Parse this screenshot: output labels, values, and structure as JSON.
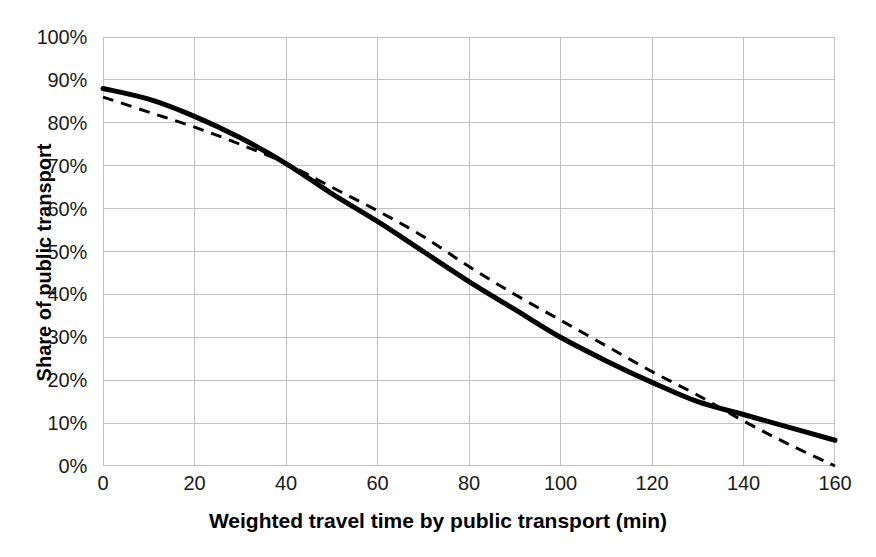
{
  "chart_data": {
    "type": "line",
    "title": "",
    "xlabel": "Weighted travel time by public transport (min)",
    "ylabel": "Share of public transport",
    "xlim": [
      0,
      160
    ],
    "ylim": [
      0,
      1.0
    ],
    "grid": true,
    "legend": "none",
    "x_ticks": [
      0,
      20,
      40,
      60,
      80,
      100,
      120,
      140,
      160
    ],
    "x_tick_labels": [
      "0",
      "20",
      "40",
      "60",
      "80",
      "100",
      "120",
      "140",
      "160"
    ],
    "y_ticks": [
      0,
      10,
      20,
      30,
      40,
      50,
      60,
      70,
      80,
      90,
      100
    ],
    "y_tick_labels": [
      "0%",
      "10%",
      "20%",
      "30%",
      "40%",
      "50%",
      "60%",
      "70%",
      "80%",
      "90%",
      "100%"
    ],
    "x": [
      0,
      10,
      20,
      30,
      40,
      50,
      60,
      70,
      80,
      90,
      100,
      110,
      120,
      130,
      140,
      150,
      160
    ],
    "series": [
      {
        "name": "Fitted logistic curve",
        "style": "solid",
        "color": "#000000",
        "width": 5,
        "values": [
          88,
          85.5,
          81.5,
          76.5,
          70.5,
          63.5,
          57,
          50,
          43,
          36.5,
          30,
          24.5,
          19.5,
          15,
          12,
          9,
          6
        ]
      },
      {
        "name": "Linear approximation",
        "style": "dashed",
        "color": "#000000",
        "width": 3,
        "values": [
          86,
          82.5,
          79,
          75,
          70.5,
          65,
          59.5,
          53.5,
          46.5,
          40,
          34,
          28,
          22,
          16.5,
          10.5,
          5,
          0
        ]
      }
    ],
    "annotations": {
      "crossings": [
        67,
        140
      ]
    },
    "colors": {
      "grid": "#c0c0c0",
      "axis": "#808080",
      "text": "#1a1a1a",
      "series": "#000000",
      "background": "#ffffff"
    }
  },
  "axes": {
    "x_title": "Weighted travel time by public transport (min)",
    "y_title": "Share of public transport"
  }
}
